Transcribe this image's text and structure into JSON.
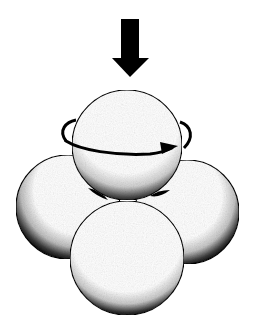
{
  "figure": {
    "description": "Four spheres in tetrahedral close packing with a downward force arrow and a rotation arrow around the top sphere",
    "colors": {
      "background": "#ffffff",
      "ink": "#000000",
      "sphere_fill": "#ffffff"
    },
    "force_arrow": {
      "direction": "down",
      "shaft": {
        "x": 121,
        "y": 19,
        "width": 18,
        "height": 41
      },
      "head": {
        "left": 112,
        "right": 149,
        "top": 58,
        "tip_x": 130,
        "tip_y": 77
      }
    },
    "spheres": [
      {
        "id": "left",
        "cx": 68,
        "cy": 207,
        "r": 52
      },
      {
        "id": "right",
        "cx": 187,
        "cy": 212,
        "r": 52
      },
      {
        "id": "top",
        "cx": 127,
        "cy": 145,
        "r": 55
      },
      {
        "id": "front",
        "cx": 127,
        "cy": 258,
        "r": 57
      }
    ],
    "rotation_arrow": {
      "cx": 127,
      "cy": 136,
      "rx": 63,
      "ry": 15,
      "direction": "clockwise-from-above",
      "head_x": 175,
      "head_y": 146
    }
  }
}
